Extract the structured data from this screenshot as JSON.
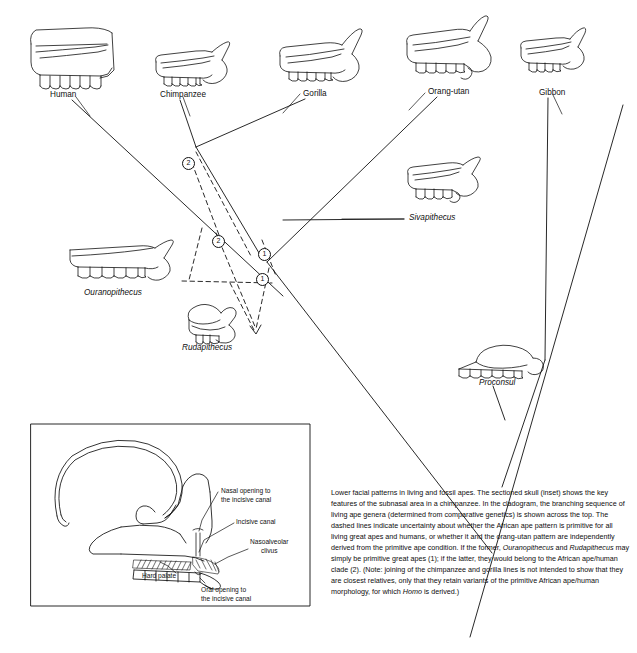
{
  "figure": {
    "domain": "scientific-diagram",
    "title_text": "Lower facial patterns in living and fossil apes",
    "caption_segments": [
      {
        "text": "Lower facial patterns in living and fossil apes. The sectioned skull (inset) shows the key features of the subnasal area in a chimpanzee. In the cladogram, the branching sequence of living ape genera (determined from comparative genetics) is shown across the top. The dashed lines indicate uncertainty about whether the African ape pattern is primitive for all living great apes and humans, or whether it and the orang-utan pattern are independently derived from the primitive ape condition. If the former, ",
        "italic": false
      },
      {
        "text": "Ouranopithecus",
        "italic": true
      },
      {
        "text": " and ",
        "italic": false
      },
      {
        "text": "Rudapithecus",
        "italic": true
      },
      {
        "text": " may simply be primitive great apes (1); if the latter, they would belong to the African ape/human clade (2). (Note: joining of the chimpanzee and gorilla lines is not intended to show that they are closest relatives, only that they retain variants of the primitive African ape/human morphology, for which ",
        "italic": false
      },
      {
        "text": "Homo",
        "italic": true
      },
      {
        "text": " is derived.)",
        "italic": false
      }
    ]
  },
  "living_taxa": [
    {
      "label": "Human",
      "label_x": 50,
      "label_y": 90
    },
    {
      "label": "Chimpanzee",
      "label_x": 160,
      "label_y": 90
    },
    {
      "label": "Gorilla",
      "label_x": 303,
      "label_y": 89
    },
    {
      "label": "Orang-utan",
      "label_x": 428,
      "label_y": 87
    },
    {
      "label": "Gibbon",
      "label_x": 539,
      "label_y": 88
    }
  ],
  "fossil_taxa": [
    {
      "label": "Sivapithecus",
      "label_x": 409,
      "label_y": 213
    },
    {
      "label": "Ouranopithecus",
      "label_x": 84,
      "label_y": 288
    },
    {
      "label": "Rudapithecus",
      "label_x": 182,
      "label_y": 343
    },
    {
      "label": "Proconsul",
      "label_x": 479,
      "label_y": 378
    }
  ],
  "cladogram_nodes": [
    {
      "id": "node-2-upper",
      "number": "2",
      "x": 182,
      "y": 157
    },
    {
      "id": "node-2-lower",
      "number": "2",
      "x": 212,
      "y": 235
    },
    {
      "id": "node-1-upper",
      "number": "1",
      "x": 258,
      "y": 248
    },
    {
      "id": "node-1-lower",
      "number": "1",
      "x": 256,
      "y": 273
    }
  ],
  "inset": {
    "subject": "chimpanzee sectioned skull, subnasal area",
    "labels": [
      {
        "id": "nasal-opening",
        "lines": [
          "Nasal opening to",
          "the incisive canal"
        ],
        "x": 221,
        "y": 487
      },
      {
        "id": "incisive-canal",
        "lines": [
          "Incisive canal"
        ],
        "x": 236,
        "y": 518
      },
      {
        "id": "nasoalveolar",
        "lines": [
          "Nasoalveolar",
          "clivus"
        ],
        "x": 250,
        "y": 538
      },
      {
        "id": "hard-palate",
        "lines": [
          "Hard palate"
        ],
        "x": 142,
        "y": 572
      },
      {
        "id": "oral-opening",
        "lines": [
          "Oral opening to",
          "the incisive canal"
        ],
        "x": 201,
        "y": 586
      }
    ]
  },
  "colors": {
    "ink": "#111111",
    "background": "#ffffff",
    "caption_text": "#0d0d0d"
  }
}
